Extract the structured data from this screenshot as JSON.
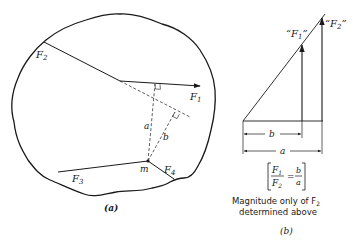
{
  "panel_a": {
    "caption": "(a)",
    "labels": {
      "f1": "F",
      "f1_sub": "1",
      "f2": "F",
      "f2_sub": "2",
      "f3": "F",
      "f3_sub": "3",
      "f4": "F",
      "f4_sub": "4",
      "m": "m",
      "a": "a",
      "b": "b"
    }
  },
  "panel_b": {
    "caption": "(b)",
    "labels": {
      "f1_quoted": "“F",
      "f1_sub": "1",
      "f1_close": "”",
      "f2_quoted": "“F",
      "f2_sub": "2",
      "f2_close": "”",
      "b": "b",
      "a": "a"
    },
    "equation": {
      "lhs_num": "F",
      "lhs_num_sub": "1",
      "lhs_den": "F",
      "lhs_den_sub": "2",
      "equals": "=",
      "rhs_num": "b",
      "rhs_den": "a"
    },
    "note_line1": "Magnitude only of F",
    "note_line1_sub": "2",
    "note_line2": "determined above"
  },
  "colors": {
    "ink": "#1a1a1a",
    "background": "#ffffff"
  }
}
